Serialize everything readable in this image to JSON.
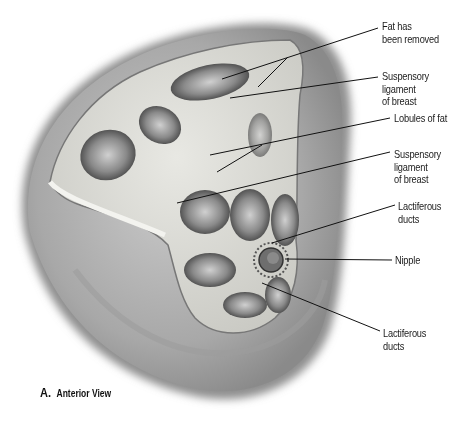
{
  "figure": {
    "panel_letter": "A.",
    "panel_title": "Anterior View",
    "labels": [
      {
        "id": "fat-removed",
        "text": "Fat has\nbeen removed"
      },
      {
        "id": "suspensory-ligament-1",
        "text": "Suspensory\nligament\nof breast"
      },
      {
        "id": "lobules-of-fat",
        "text": "Lobules of fat"
      },
      {
        "id": "suspensory-ligament-2",
        "text": "Suspensory\nligament\nof breast"
      },
      {
        "id": "lactiferous-ducts-1",
        "text": "Lactiferous\nducts"
      },
      {
        "id": "nipple",
        "text": "Nipple"
      },
      {
        "id": "lactiferous-ducts-2",
        "text": "Lactiferous\nducts"
      }
    ]
  },
  "colors": {
    "background": "#ffffff",
    "skin_outer": "#9a9a9a",
    "skin_inner": "#b8b8b8",
    "tissue": "#d9d9d4",
    "cavity": "#4a4a4a",
    "leader": "#111111",
    "text": "#1a1a1a"
  }
}
